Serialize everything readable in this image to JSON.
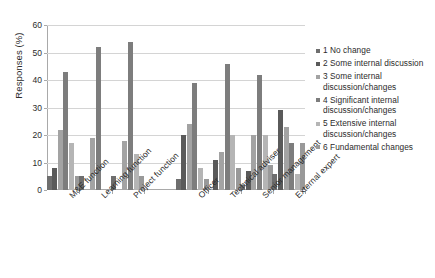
{
  "chart_data": {
    "type": "bar",
    "title": "",
    "xlabel": "",
    "ylabel": "Responses (%)",
    "ylim": [
      0,
      60
    ],
    "ytick_labels": [
      "0",
      "10",
      "20",
      "30",
      "40",
      "50",
      "60"
    ],
    "ytick_values": [
      0,
      10,
      20,
      30,
      40,
      50,
      60
    ],
    "grid": true,
    "legend_position": "right",
    "categories": [
      "M&E function",
      "Learning function",
      "Project function",
      "Officer",
      "Technical adviser",
      "Senior management",
      "External expert"
    ],
    "category_gap_after": 2,
    "series": [
      {
        "name": "1 No change",
        "color": "#6e6e6e",
        "values": [
          5,
          5,
          5,
          4,
          0,
          2,
          6
        ]
      },
      {
        "name": "2 Some internal discussion",
        "color": "#5a5a5a",
        "values": [
          8,
          0,
          0,
          20,
          11,
          7,
          29
        ]
      },
      {
        "name": "3 Some internal discussion/changes",
        "color": "#a3a3a3",
        "values": [
          22,
          19,
          18,
          24,
          14,
          20,
          23
        ]
      },
      {
        "name": "4 Significant internal discussion/changes",
        "color": "#7d7d7d",
        "values": [
          43,
          52,
          54,
          39,
          46,
          42,
          17
        ]
      },
      {
        "name": "5 Extensive internal discussion/changes",
        "color": "#b5b5b5",
        "values": [
          17,
          0,
          13,
          8,
          20,
          20,
          6
        ]
      },
      {
        "name": "6 Fundamental changes",
        "color": "#999999",
        "values": [
          5,
          0,
          5,
          4,
          8,
          9,
          17
        ]
      }
    ]
  },
  "axis": {
    "y_title": "Responses (%)"
  },
  "legend": {
    "items": [
      {
        "label": "1 No change",
        "color": "#6e6e6e"
      },
      {
        "label": "2 Some internal discussion",
        "color": "#5a5a5a"
      },
      {
        "label": "3 Some internal discussion/changes",
        "color": "#a3a3a3"
      },
      {
        "label": "4 Significant internal discussion/changes",
        "color": "#7d7d7d"
      },
      {
        "label": "5 Extensive internal discussion/changes",
        "color": "#b5b5b5"
      },
      {
        "label": "6 Fundamental changes",
        "color": "#999999"
      }
    ]
  }
}
